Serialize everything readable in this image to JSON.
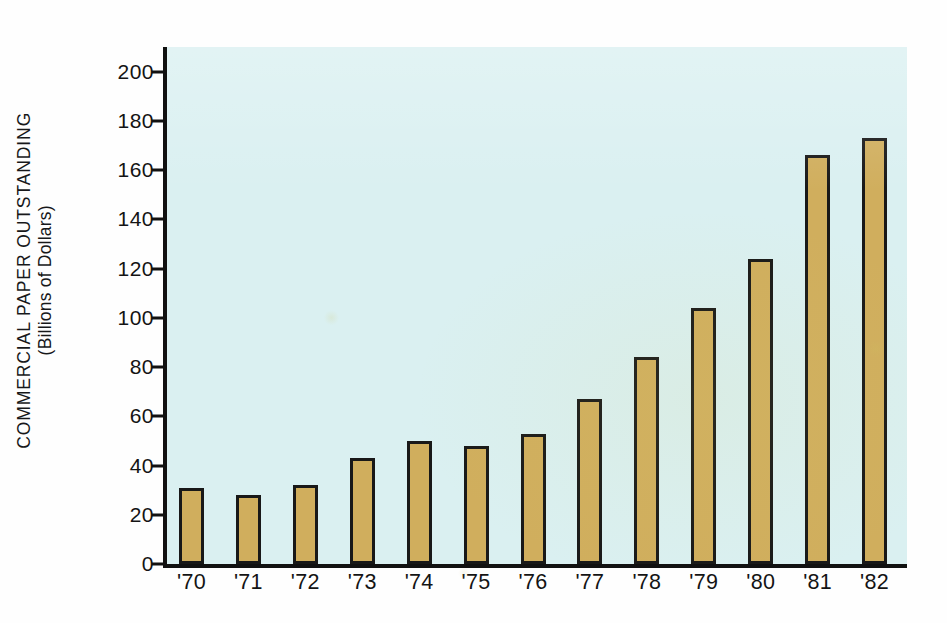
{
  "chart_data": {
    "type": "bar",
    "title": "",
    "subtitle": "",
    "xlabel": "",
    "ylabel": "COMMERCIAL PAPER OUTSTANDING (Billions of Dollars)",
    "ylabel_line1": "COMMERCIAL PAPER OUTSTANDING",
    "ylabel_line2": "(Billions of Dollars)",
    "categories": [
      "'70",
      "'71",
      "'72",
      "'73",
      "'74",
      "'75",
      "'76",
      "'77",
      "'78",
      "'79",
      "'80",
      "'81",
      "'82"
    ],
    "values": [
      31,
      28,
      32,
      43,
      50,
      48,
      53,
      67,
      84,
      104,
      124,
      166,
      173
    ],
    "ylim": [
      0,
      210
    ],
    "yticks": [
      0,
      20,
      40,
      60,
      80,
      100,
      120,
      140,
      160,
      180,
      200
    ],
    "ytick_labels": [
      "0",
      "20",
      "40",
      "60",
      "80",
      "100",
      "120",
      "140",
      "160",
      "180",
      "200"
    ],
    "grid": false,
    "legend": null,
    "legend_position": "none",
    "bar_color": "#d0ae5d",
    "bar_edge_color": "#181818",
    "plot_background": "#daf0f1",
    "figure_background": "#fefefe",
    "axis_color": "#111111",
    "text_color": "#141414"
  }
}
